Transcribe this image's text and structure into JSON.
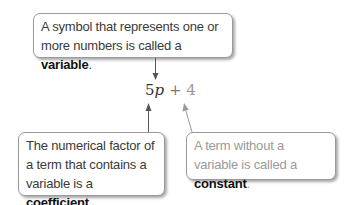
{
  "callouts": {
    "variable": {
      "text_before": "A symbol that represents one or more numbers is called a ",
      "term": "variable",
      "text_after": "."
    },
    "coefficient": {
      "text_before": "The numerical factor of a term that contains a variable is a ",
      "term": "coefficient",
      "text_after": "."
    },
    "constant": {
      "text_before": "A term without a variable is called a ",
      "term": "constant",
      "text_after": "."
    }
  },
  "expression": {
    "coefficient": "5",
    "variable": "p",
    "operator": " + ",
    "constant": "4"
  },
  "colors": {
    "arrow_dark": "#555555",
    "arrow_light": "#9a9a9a",
    "border": "#9a9a9a",
    "text_dark": "#3a3a3a",
    "text_light": "#9a9a9a"
  }
}
